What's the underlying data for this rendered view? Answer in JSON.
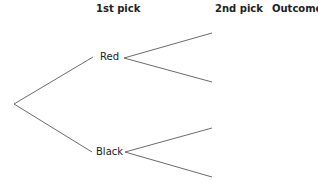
{
  "headers": {
    "first_pick": "1st pick",
    "second_pick": "2nd pick",
    "outcome": "Outcome"
  },
  "nodes": {
    "first": [
      {
        "label": "Red"
      },
      {
        "label": "Black"
      }
    ]
  },
  "colors": {
    "line": "#6b6b6b",
    "text": "#222222"
  }
}
